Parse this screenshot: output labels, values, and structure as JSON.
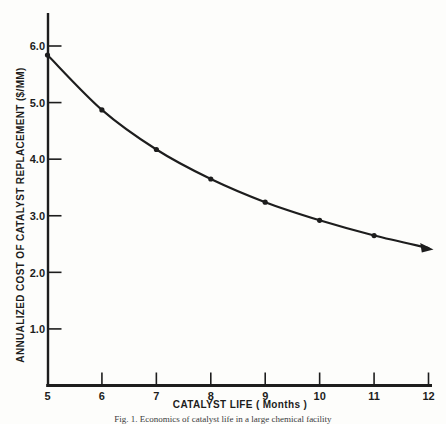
{
  "figure": {
    "caption": "Fig. 1. Economics of catalyst life in a large chemical facility"
  },
  "colors": {
    "ink": "#1d1d1d",
    "paper": "#fdfdfb"
  },
  "chart_data": {
    "type": "line",
    "title": "",
    "xlabel": "CATALYST LIFE ( Months )",
    "ylabel": "ANNUALIZED COST OF CATALYST REPLACEMENT ($/MM)",
    "x": [
      5,
      6,
      7,
      8,
      9,
      10,
      11,
      12
    ],
    "series": [
      {
        "name": "annualized-catalyst-replacement-cost",
        "values": [
          5.84,
          4.87,
          4.17,
          3.65,
          3.24,
          2.92,
          2.65,
          2.43
        ]
      }
    ],
    "xlim": [
      5,
      12
    ],
    "ylim": [
      0,
      6.2
    ],
    "x_tick_values": [
      5,
      6,
      7,
      8,
      9,
      10,
      11,
      12
    ],
    "x_tick_labels": [
      "5",
      "6",
      "7",
      "8",
      "9",
      "10",
      "11",
      "12"
    ],
    "y_tick_values": [
      1,
      2,
      3,
      4,
      5,
      6
    ],
    "y_tick_labels": [
      "1.0",
      "2.0",
      "3.0",
      "4.0",
      "5.0",
      "6.0"
    ],
    "grid": false,
    "legend": "none",
    "marker": "filled-circle",
    "end_marker": "filled-arrowhead",
    "curve_shape": "hyperbolic-decay"
  }
}
